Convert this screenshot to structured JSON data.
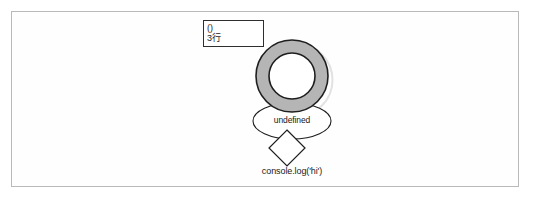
{
  "figure": {
    "domain_type": "diagram",
    "background_color": "#ffffff",
    "frame_border_color": "#b9b9bb"
  },
  "annotation_box": {
    "name": "call-stack-annotation",
    "line_1": "()",
    "line_2": "3行",
    "border_color": "#2e2e2e",
    "fill_color": "#ffffff"
  },
  "shapes": {
    "donut": {
      "name": "torus-node",
      "fill_color": "#b5b5b5",
      "stroke_color": "#1e1e1e",
      "shadow_color": "#c9c9c9",
      "center_x": 292,
      "center_y": 76,
      "outer_radius": 36,
      "inner_radius": 23
    },
    "ellipse": {
      "name": "return-value-ellipse",
      "label": "undefined",
      "fill_color": "#ffffff",
      "stroke_color": "#1e1e1e",
      "center_x": 292,
      "center_y": 121,
      "radius_x": 39,
      "radius_y": 18
    },
    "diamond": {
      "name": "statement-diamond",
      "fill_color": "#ffffff",
      "stroke_color": "#1e1e1e",
      "center_x": 287,
      "center_y": 148,
      "half_width": 18,
      "half_height": 18
    }
  },
  "caption": {
    "name": "code-caption",
    "text": "console.log('hi')"
  }
}
